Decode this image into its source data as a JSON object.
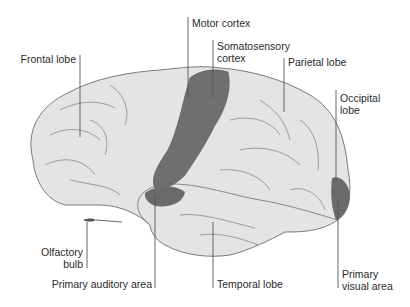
{
  "diagram": {
    "colors": {
      "brain_fill": "#e3e3e3",
      "highlight_fill": "#6e6e6e",
      "outline": "#7a7a7a",
      "leader": "#555555"
    },
    "labels": {
      "frontal_lobe": "Frontal lobe",
      "motor_cortex": "Motor cortex",
      "somatosensory_1": "Somatosensory",
      "somatosensory_2": "cortex",
      "parietal_lobe": "Parietal lobe",
      "occipital_1": "Occipital",
      "occipital_2": "lobe",
      "olfactory_1": "Olfactory",
      "olfactory_2": "bulb",
      "primary_auditory": "Primary auditory area",
      "temporal_lobe": "Temporal lobe",
      "primary_visual_1": "Primary",
      "primary_visual_2": "visual area"
    }
  }
}
